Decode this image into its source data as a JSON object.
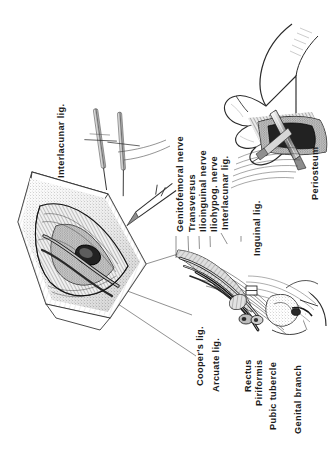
{
  "plate": {
    "title": "Inguinal region surgical exposure",
    "background_color": "#ffffff",
    "ink_color": "#1b1b1b",
    "text_orientation": "rotated-90-ccw",
    "panels": [
      {
        "name": "upper-left-incision",
        "description": "Opened lens-shaped inguinal incision with suture needles and retractors"
      },
      {
        "name": "upper-right-hand",
        "description": "Surgeon's hand holding a periosteal elevator against the pubic bone"
      },
      {
        "name": "lower-center-anatomy",
        "description": "Inguinal canal anatomy showing nerves, muscle and ligaments"
      }
    ]
  },
  "labels": {
    "interlacunar_top": "Interlacunar lig.",
    "genitofemoral_nerve": "Genitofemoral nerve",
    "transversus": "Transversus",
    "ilioinguinal_nerve": "Ilioinguinal nerve",
    "iliohypogastric_nerve": "Iliohypog. nerve",
    "interlacunar_lig": "Interlacunar lig.",
    "inguinal_lig": "Inguinal lig.",
    "periosteum": "Periosteum",
    "coopers_lig": "Cooper's lig.",
    "arcuate_lig": "Arcuate lig.",
    "rectus": "Rectus",
    "piriformis": "Piriformis",
    "pubic_tubercle": "Pubic tubercle",
    "genital_branch": "Genital branch"
  }
}
